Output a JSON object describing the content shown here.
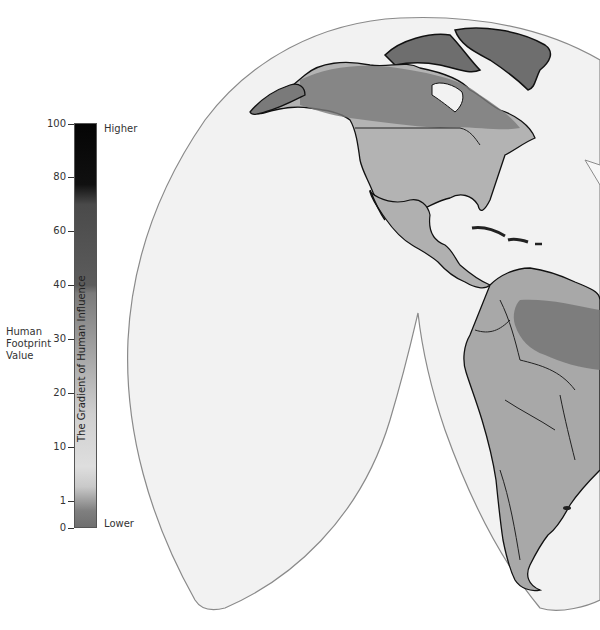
{
  "legend": {
    "axis_title_lines": [
      "Human",
      "Footprint",
      "Value"
    ],
    "bar_title": "The Gradient of Human Influence",
    "top_label": "Higher",
    "bottom_label": "Lower",
    "ticks": [
      {
        "label": "100",
        "y": 124
      },
      {
        "label": "80",
        "y": 177
      },
      {
        "label": "60",
        "y": 231
      },
      {
        "label": "40",
        "y": 285
      },
      {
        "label": "30",
        "y": 339
      },
      {
        "label": "20",
        "y": 393
      },
      {
        "label": "10",
        "y": 447
      },
      {
        "label": "1",
        "y": 501
      },
      {
        "label": "0",
        "y": 528
      }
    ]
  },
  "map": {
    "projection": "interrupted (Goode homolosine-like), Americas lobe",
    "visible_regions": [
      "North America",
      "Greenland",
      "Central America",
      "Caribbean",
      "South America"
    ],
    "ocean_color": "#f2f2f2",
    "outline_color": "#8a8a8a",
    "land_high_color": "#6e6e6e",
    "land_low_color": "#c8c8c8"
  }
}
